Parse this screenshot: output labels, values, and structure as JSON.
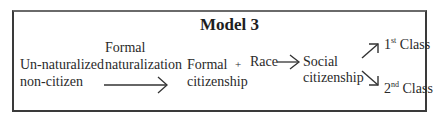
{
  "diagram": {
    "title": "Model 3",
    "nodes": {
      "unnaturalized": {
        "line1": "Un-naturalized",
        "line2": "non-citizen"
      },
      "formal_naturalization": {
        "line1": "Formal",
        "line2": "naturalization"
      },
      "formal_citizenship": {
        "line1": "Formal",
        "line2": "citizenship"
      },
      "plus": "+",
      "race": "Race",
      "social_citizenship": {
        "line1": "Social",
        "line2": "citizenship"
      },
      "first_class": {
        "num": "1",
        "sup": "st",
        "label": " Class"
      },
      "second_class": {
        "num": "2",
        "sup": "nd",
        "label": " Class"
      }
    },
    "edges": [
      {
        "from": "Un-naturalized non-citizen",
        "to": "Formal citizenship",
        "label": "Formal naturalization"
      },
      {
        "from": "Formal citizenship + Race",
        "to": "Social citizenship"
      },
      {
        "from": "Social citizenship",
        "to": "1st Class"
      },
      {
        "from": "Social citizenship",
        "to": "2nd Class"
      }
    ]
  }
}
